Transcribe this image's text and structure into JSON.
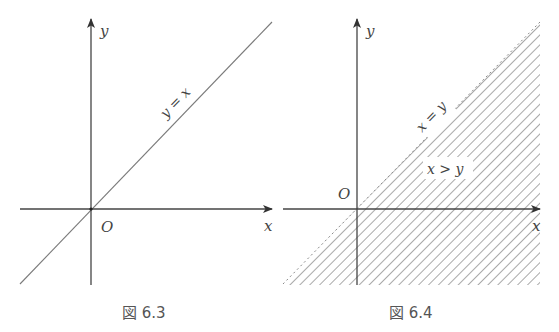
{
  "figures": [
    {
      "id": "fig-6-3",
      "caption": "図 6.3",
      "axis_labels": {
        "x": "x",
        "y": "y",
        "origin": "O"
      },
      "line_label": "y = x",
      "line_color": "#777777",
      "axis_color": "#444444"
    },
    {
      "id": "fig-6-4",
      "caption": "図 6.4",
      "axis_labels": {
        "x": "x",
        "y": "y",
        "origin": "O"
      },
      "line_label": "x = y",
      "region_label": "x > y",
      "hatch_color": "#7a7a7a",
      "axis_color": "#444444"
    }
  ]
}
